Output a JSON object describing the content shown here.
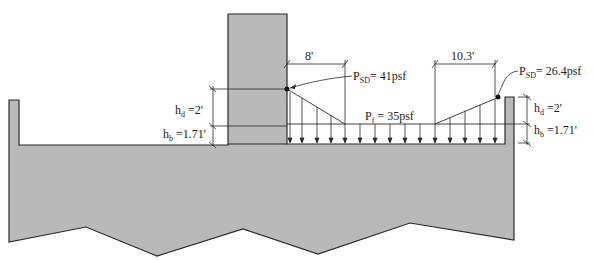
{
  "diagram": {
    "type": "snow drift load on roof",
    "colors": {
      "structure_fill": "#b9b9b9",
      "stroke": "#2a2a2a",
      "background": "#ffffff"
    },
    "labels": {
      "left_drift_length": "8'",
      "right_drift_length": "10.3'",
      "left_peak_pressure_prefix": "P",
      "left_peak_pressure_sub": "SD",
      "left_peak_pressure_value": "= 41psf",
      "right_peak_pressure_prefix": "P",
      "right_peak_pressure_sub": "SD",
      "right_peak_pressure_value": "= 26.4psf",
      "flat_pressure_prefix": "P",
      "flat_pressure_sub": "f",
      "flat_pressure_value": " = 35psf",
      "left_hd_prefix": "h",
      "left_hd_sub": "d",
      "left_hd_value": " =2'",
      "left_hb_prefix": "h",
      "left_hb_sub": "b",
      "left_hb_value": " =1.71'",
      "right_hd_prefix": "h",
      "right_hd_sub": "d",
      "right_hd_value": " =2'",
      "right_hb_prefix": "h",
      "right_hb_sub": "b",
      "right_hb_value": " =1.71'"
    },
    "values": {
      "P_SD_left_psf": 41,
      "P_SD_right_psf": 26.4,
      "P_f_psf": 35,
      "h_d_ft": 2,
      "h_b_ft": 1.71,
      "left_drift_width_ft": 8,
      "right_drift_width_ft": 10.3
    }
  }
}
